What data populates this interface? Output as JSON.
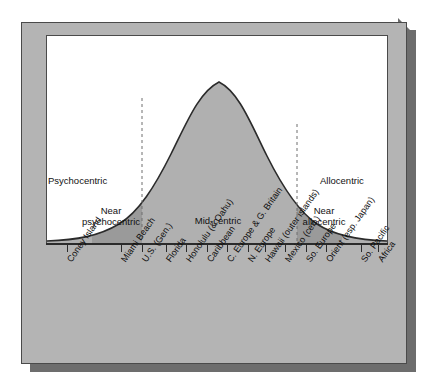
{
  "figure": {
    "kind": "psychographic-distribution-diagram",
    "zones": {
      "psychocentric": "Psychocentric",
      "near_psychocentric_line1": "Near",
      "near_psychocentric_line2": "psychocentric",
      "mid_centric": "Mid-centric",
      "near_allocentric_line1": "Near",
      "near_allocentric_line2": "allocentric",
      "allocentric": "Allocentric"
    },
    "colors": {
      "panel": "#b4b4b4",
      "slab_shadow": "#6d6d6d",
      "plot_background": "#ffffff",
      "curve_fill_mid": "#b0b0b0",
      "curve_fill_near": "#9a9a9a",
      "tail_band": "#d8d8d8",
      "curve_stroke": "#2b2b2b",
      "label_text": "#0d0d0d"
    }
  },
  "chart_data": {
    "type": "area",
    "title": "",
    "subtitle": "",
    "xlabel": "",
    "ylabel": "",
    "grid": false,
    "legend_position": "none",
    "distribution": "normal bell curve of tourist psychographic types",
    "xlim": [
      0,
      100
    ],
    "ylim": [
      0,
      100
    ],
    "peak": {
      "x": 50,
      "y": 100
    },
    "curve_points": [
      {
        "x": 0,
        "y": 1.5
      },
      {
        "x": 5,
        "y": 2.5
      },
      {
        "x": 10,
        "y": 4
      },
      {
        "x": 15,
        "y": 7
      },
      {
        "x": 20,
        "y": 13
      },
      {
        "x": 25,
        "y": 23
      },
      {
        "x": 30,
        "y": 38
      },
      {
        "x": 35,
        "y": 55
      },
      {
        "x": 40,
        "y": 73
      },
      {
        "x": 45,
        "y": 90
      },
      {
        "x": 50,
        "y": 100
      },
      {
        "x": 55,
        "y": 97
      },
      {
        "x": 60,
        "y": 86
      },
      {
        "x": 65,
        "y": 70
      },
      {
        "x": 70,
        "y": 52
      },
      {
        "x": 75,
        "y": 35
      },
      {
        "x": 80,
        "y": 21
      },
      {
        "x": 85,
        "y": 12
      },
      {
        "x": 90,
        "y": 6
      },
      {
        "x": 95,
        "y": 3
      },
      {
        "x": 100,
        "y": 1.5
      }
    ],
    "zone_boundaries": [
      {
        "label": "psychocentric / near psychocentric",
        "x": 13
      },
      {
        "label": "near psychocentric / mid-centric",
        "x": 28
      },
      {
        "label": "mid-centric / near allocentric",
        "x": 73
      },
      {
        "label": "near allocentric / allocentric",
        "x": 85
      }
    ],
    "zone_spans": [
      {
        "name": "Psychocentric",
        "x_start": 0,
        "x_end": 13
      },
      {
        "name": "Near psychocentric",
        "x_start": 13,
        "x_end": 28
      },
      {
        "name": "Mid-centric",
        "x_start": 28,
        "x_end": 73
      },
      {
        "name": "Near allocentric",
        "x_start": 73,
        "x_end": 85
      },
      {
        "name": "Allocentric",
        "x_start": 85,
        "x_end": 100
      }
    ],
    "categories": [
      "Coney Island",
      "Miami Beach",
      "U.S. (Gen.)",
      "Florida",
      "Honolulu (& Oahu)",
      "Caribbean",
      "C. Europe & G. Britain",
      "N. Europe",
      "Hawaii (outer islands)",
      "Mexico (cen.)",
      "So. Europe",
      "Orient (esp. Japan)",
      "So. Pacific",
      "Africa"
    ],
    "tick_x": [
      6,
      22,
      28,
      35,
      41,
      47,
      53,
      59,
      64,
      70,
      76,
      82,
      92,
      97
    ]
  }
}
